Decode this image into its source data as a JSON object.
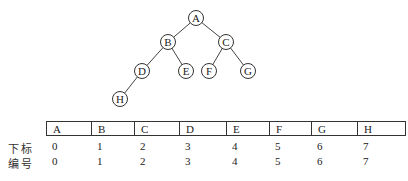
{
  "tree": {
    "nodes": [
      {
        "id": "A",
        "label": "A",
        "x": 196,
        "y": 18
      },
      {
        "id": "B",
        "label": "B",
        "x": 168,
        "y": 42
      },
      {
        "id": "C",
        "label": "C",
        "x": 226,
        "y": 42
      },
      {
        "id": "D",
        "label": "D",
        "x": 142,
        "y": 71
      },
      {
        "id": "E",
        "label": "E",
        "x": 186,
        "y": 71
      },
      {
        "id": "F",
        "label": "F",
        "x": 209,
        "y": 71
      },
      {
        "id": "G",
        "label": "G",
        "x": 248,
        "y": 71
      },
      {
        "id": "H",
        "label": "H",
        "x": 120,
        "y": 99
      }
    ],
    "edges": [
      [
        "A",
        "B"
      ],
      [
        "A",
        "C"
      ],
      [
        "B",
        "D"
      ],
      [
        "B",
        "E"
      ],
      [
        "C",
        "F"
      ],
      [
        "C",
        "G"
      ],
      [
        "D",
        "H"
      ]
    ]
  },
  "array": {
    "cells": [
      "A",
      "B",
      "C",
      "D",
      "E",
      "F",
      "G",
      "H"
    ],
    "widths": [
      45,
      43,
      45,
      47,
      43,
      42,
      46,
      47
    ],
    "offsets": [
      52,
      97,
      140,
      185,
      232,
      275,
      317,
      363
    ]
  },
  "rows": [
    {
      "label": "下标",
      "values": [
        "0",
        "1",
        "2",
        "3",
        "4",
        "5",
        "6",
        "7"
      ]
    },
    {
      "label": "编号",
      "values": [
        "0",
        "1",
        "2",
        "3",
        "4",
        "5",
        "6",
        "7"
      ]
    }
  ]
}
